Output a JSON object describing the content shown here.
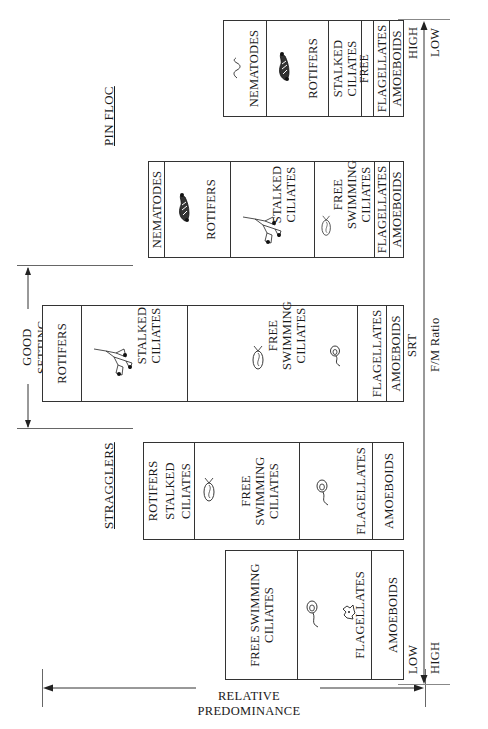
{
  "diagram": {
    "regions": {
      "stragglers": "STRAGGLERS",
      "good_setting": "GOOD SETTING",
      "pin_floc": "PIN FLOC"
    },
    "y_axis": {
      "label": "RELATIVE PREDOMINANCE"
    },
    "x_axis": {
      "label_srt": "SRT",
      "label_fm": "F/M Ratio",
      "left_end": {
        "srt": "LOW",
        "fm": "HIGH"
      },
      "right_end": {
        "srt": "HIGH",
        "fm": "LOW"
      }
    },
    "stacks": [
      {
        "name": "stack-1",
        "cells": [
          {
            "label": "FREE SWIMMING\nCILIATES",
            "icon": "flagellate"
          },
          {
            "label": "FLAGELLATES",
            "icon": "none"
          },
          {
            "label": "AMOEBOIDS",
            "icon": "amoeba"
          }
        ]
      },
      {
        "name": "stack-2",
        "cells": [
          {
            "label": "ROTIFERS"
          },
          {
            "label": "STALKED"
          },
          {
            "label": "CILIATES"
          },
          {
            "label": "FREE\nSWIMMING\nCILIATES",
            "icon": "free-ciliate"
          },
          {
            "label": "FLAGELLATES",
            "icon": "flagellate"
          },
          {
            "label": "AMOEBOIDS"
          }
        ]
      },
      {
        "name": "stack-3",
        "cells": [
          {
            "label": "ROTIFERS"
          },
          {
            "label": "STALKED\nCILIATES",
            "icon": "stalked-ciliate"
          },
          {
            "label": "FREE\nSWIMMING\nCILIATES",
            "icon": "free-ciliate"
          },
          {
            "label": "FLAGELLATES",
            "icon": "flagellate"
          },
          {
            "label": "AMOEBOIDS"
          }
        ]
      },
      {
        "name": "stack-4",
        "cells": [
          {
            "label": "NEMATODES"
          },
          {
            "label": "ROTIFERS",
            "icon": "rotifer"
          },
          {
            "label": "STALKED\nCILIATES",
            "icon": "stalked-ciliate"
          },
          {
            "label": "FREE\nSWIMMING\nCILIATES",
            "icon": "free-ciliate"
          },
          {
            "label": "FLAGELLATES"
          },
          {
            "label": "AMOEBOIDS"
          }
        ]
      },
      {
        "name": "stack-5",
        "cells": [
          {
            "label": "NEMATODES",
            "icon": "nematode"
          },
          {
            "label": "ROTIFERS",
            "icon": "rotifer"
          },
          {
            "label": "STALKED\nCILIATES"
          },
          {
            "label": "FREE SWIMMING\nCILIATES"
          },
          {
            "label": "FLAGELLATES"
          },
          {
            "label": "AMOEBOIDS"
          }
        ]
      }
    ]
  }
}
